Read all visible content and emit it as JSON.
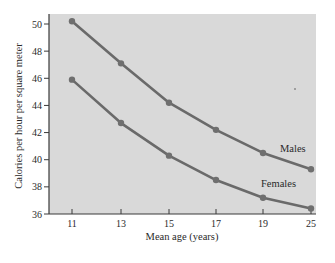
{
  "chart_data": {
    "type": "line",
    "title": "",
    "xlabel": "Mean age (years)",
    "ylabel": "Calories per hour per square meter",
    "categories": [
      "11",
      "13",
      "15",
      "17",
      "19",
      "25"
    ],
    "x": [
      11,
      13,
      15,
      17,
      19,
      25
    ],
    "yticks": [
      36,
      38,
      40,
      42,
      44,
      46,
      48,
      50
    ],
    "ylim": [
      36,
      50.5
    ],
    "grid": false,
    "legend": "inline labels",
    "series": [
      {
        "name": "Males",
        "values": [
          50.2,
          47.1,
          44.2,
          42.2,
          40.5,
          39.3
        ]
      },
      {
        "name": "Females",
        "values": [
          45.9,
          42.7,
          40.3,
          38.5,
          37.2,
          36.4
        ]
      }
    ],
    "annotations": [
      {
        "text": "Males",
        "near": "x=19..25 above Males line"
      },
      {
        "text": "Females",
        "near": "x=19..25 above Females line"
      }
    ]
  },
  "colors": {
    "plot_background": "#d9d9d9",
    "line": "#6a6a6a",
    "marker": "#6f6f6f",
    "axis": "#3a3a3a",
    "text": "#2a2a2a"
  }
}
